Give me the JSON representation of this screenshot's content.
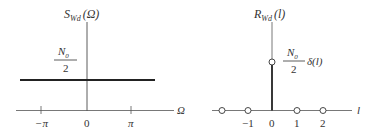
{
  "left_panel": {
    "title": "S",
    "title_sub": "Wd",
    "title_arg": "(Ω)",
    "level_numerator": "N",
    "level_numerator_sub": "0",
    "level_denominator": "2",
    "x_axis_label": "Ω",
    "ticks": [
      {
        "label": "−π",
        "x": 41
      },
      {
        "label": "0",
        "x": 87
      },
      {
        "label": "π",
        "x": 131
      }
    ]
  },
  "right_panel": {
    "title": "R",
    "title_sub": "Wd",
    "title_arg": "(l)",
    "impulse_numerator": "N",
    "impulse_numerator_sub": "0",
    "impulse_denominator": "2",
    "impulse_suffix": "δ(l)",
    "x_axis_label": "l",
    "ticks": [
      {
        "label": "−1",
        "x": 248
      },
      {
        "label": "0",
        "x": 272
      },
      {
        "label": "1",
        "x": 297
      },
      {
        "label": "2",
        "x": 323
      }
    ],
    "sample_points_x": [
      222,
      248,
      297,
      323
    ]
  },
  "colors": {
    "line": "#222222",
    "text": "#333333"
  }
}
